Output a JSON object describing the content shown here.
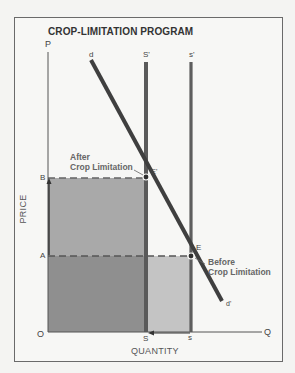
{
  "title": "CROP-LIMITATION PROGRAM",
  "axes": {
    "y_label": "PRICE",
    "x_label": "QUANTITY",
    "y_symbol": "P",
    "x_symbol": "Q",
    "origin": "O"
  },
  "price_levels": {
    "high": "B",
    "low": "A"
  },
  "quantity_levels": {
    "restricted": "S",
    "original": "s"
  },
  "curves": {
    "demand_top": "d",
    "demand_bottom": "d'",
    "supply_restricted": "S'",
    "supply_original": "s'"
  },
  "equilibria": {
    "after": {
      "label": "E'",
      "note_line1": "After",
      "note_line2": "Crop Limitation"
    },
    "before": {
      "label": "E",
      "note_line1": "Before",
      "note_line2": "Crop Limitation"
    }
  },
  "colors": {
    "revenue_after": "#a9a9a9",
    "revenue_overlap": "#8e8e8e",
    "revenue_lost": "#c6c6c6",
    "curve": "#4a4a4a",
    "supply_line": "#5e5e5e"
  }
}
